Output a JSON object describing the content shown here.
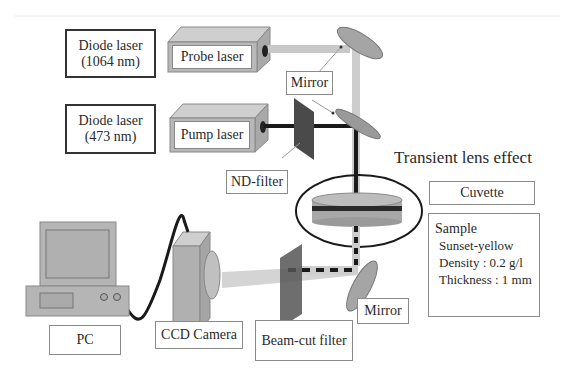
{
  "diagram": {
    "title": "Transient lens effect",
    "components": {
      "diode_probe": {
        "line1": "Diode laser",
        "line2": "(1064 nm)"
      },
      "diode_pump": {
        "line1": "Diode laser",
        "line2": "(473 nm)"
      },
      "probe_laser": "Probe laser",
      "pump_laser": "Pump laser",
      "mirror_top": "Mirror",
      "nd_filter": "ND-filter",
      "cuvette": "Cuvette",
      "mirror_bottom": "Mirror",
      "beam_cut_filter": "Beam-cut filter",
      "ccd_camera": "CCD Camera",
      "pc": "PC"
    },
    "sample": {
      "heading": "Sample",
      "name": "Sunset-yellow",
      "density": "Density : 0.2 g/l",
      "thickness": "Thickness : 1 mm"
    },
    "colors": {
      "probe_beam": "#c8c8c8",
      "pump_beam": "#1a1a1a",
      "device_fill": "#b5b5b5",
      "device_top": "#cfcfcf",
      "filter_fill": "#555555",
      "border": "#333333"
    }
  }
}
